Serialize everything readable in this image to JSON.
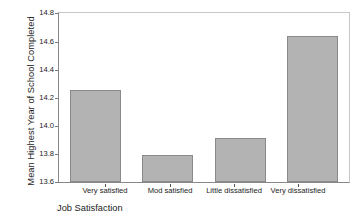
{
  "chart_data": {
    "type": "bar",
    "title": "",
    "xlabel": "Job Satisfaction",
    "ylabel": "Mean Highest Year of School Completed",
    "categories": [
      "Very satisfied",
      "Mod satisfied",
      "Little dissatisfied",
      "Very dissatisfied"
    ],
    "values": [
      14.25,
      13.79,
      13.91,
      14.64
    ],
    "ylim": [
      13.6,
      14.8
    ],
    "yticks": [
      "13.6",
      "13.8",
      "14.0",
      "14.2",
      "14.4",
      "14.6",
      "14.8"
    ],
    "ytick_values": [
      13.6,
      13.8,
      14.0,
      14.2,
      14.4,
      14.6,
      14.8
    ],
    "grid": false,
    "legend": false,
    "bar_color": "#b3b3b3",
    "bar_edge_color": "#8a8a8a",
    "axis_color": "#888888",
    "background": "#ffffff"
  },
  "axes": {
    "y_title": "Mean Highest Year of School Completed",
    "x_title": "Job Satisfaction"
  },
  "ytick_labels": {
    "t0": "13.6",
    "t1": "13.8",
    "t2": "14.0",
    "t3": "14.2",
    "t4": "14.4",
    "t5": "14.6",
    "t6": "14.8"
  },
  "xtick_labels": {
    "c0": "Very satisfied",
    "c1": "Mod satisfied",
    "c2": "Little dissatisfied",
    "c3": "Very dissatisfied"
  }
}
